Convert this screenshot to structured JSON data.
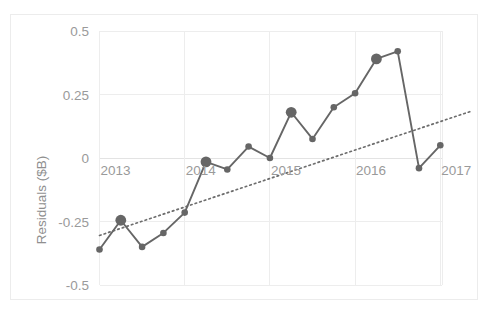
{
  "chart_data": {
    "type": "line",
    "title": "",
    "xlabel": "",
    "ylabel": "Residuals ($B)",
    "ylim": [
      -0.5,
      0.5
    ],
    "xlim": [
      2013.0,
      2017.25
    ],
    "grid": true,
    "legend": false,
    "ytick_labels": [
      "0.5",
      "0.25",
      "0",
      "-0.25",
      "-0.5"
    ],
    "ytick_values": [
      0.5,
      0.25,
      0,
      -0.25,
      -0.5
    ],
    "xtick_labels": [
      "2013",
      "2014",
      "2015",
      "2016",
      "2017"
    ],
    "xtick_values": [
      2013,
      2014,
      2015,
      2016,
      2017
    ],
    "x": [
      2013.0,
      2013.25,
      2013.5,
      2013.75,
      2014.0,
      2014.25,
      2014.5,
      2014.75,
      2015.0,
      2015.25,
      2015.5,
      2015.75,
      2016.0,
      2016.25,
      2016.5,
      2016.75,
      2017.0
    ],
    "values": [
      -0.36,
      -0.245,
      -0.35,
      -0.295,
      -0.215,
      -0.015,
      -0.045,
      0.045,
      0.0,
      0.18,
      0.075,
      0.2,
      0.255,
      0.39,
      0.42,
      -0.04,
      0.05
    ],
    "marker_sizes": [
      "small",
      "large",
      "small",
      "small",
      "small",
      "large",
      "small",
      "small",
      "small",
      "large",
      "small",
      "small",
      "small",
      "large",
      "small",
      "small",
      "small"
    ],
    "series": [
      {
        "name": "Residuals",
        "style": "solid-line-with-markers",
        "color": "#666666",
        "values": [
          -0.36,
          -0.245,
          -0.35,
          -0.295,
          -0.215,
          -0.015,
          -0.045,
          0.045,
          0.0,
          0.18,
          0.075,
          0.2,
          0.255,
          0.39,
          0.42,
          -0.04,
          0.05
        ]
      },
      {
        "name": "Trend",
        "style": "dotted-line",
        "color": "#6d6d6d",
        "endpoints": [
          {
            "x": 2013.0,
            "y": -0.305
          },
          {
            "x": 2017.37,
            "y": 0.185
          }
        ]
      }
    ]
  },
  "axes": {
    "y_axis_title": "Residuals ($B)",
    "y_ticks": [
      "0.5",
      "0.25",
      "0",
      "-0.25",
      "-0.5"
    ],
    "x_ticks": [
      "2013",
      "2014",
      "2015",
      "2016",
      "2017"
    ]
  },
  "colors": {
    "series": "#666666",
    "trend": "#6d6d6d",
    "grid": "#ededed",
    "tick_text": "#9a9a9a",
    "border": "#ececec",
    "background": "#ffffff"
  }
}
